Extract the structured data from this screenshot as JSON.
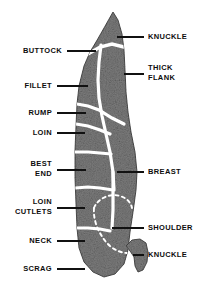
{
  "diagram": {
    "colors": {
      "meat_fill": "#7d7d7d",
      "meat_fill_dark": "#6a6a6a",
      "outline": "#3a3a3a",
      "separator": "#ffffff",
      "label_text": "#0d0d0d",
      "leader_line": "#111111",
      "background": "#ffffff"
    },
    "left_labels": [
      {
        "id": "buttock",
        "lines": [
          "BUTTOCK"
        ],
        "text_x": 62,
        "text_y": 51,
        "leader_x1": 67,
        "leader_x2": 96,
        "leader_y": 51
      },
      {
        "id": "fillet",
        "lines": [
          "FILLET"
        ],
        "text_x": 52,
        "text_y": 86,
        "leader_x1": 57,
        "leader_x2": 88,
        "leader_y": 86
      },
      {
        "id": "rump",
        "lines": [
          "RUMP"
        ],
        "text_x": 52,
        "text_y": 113,
        "leader_x1": 57,
        "leader_x2": 86,
        "leader_y": 113
      },
      {
        "id": "loin",
        "lines": [
          "LOIN"
        ],
        "text_x": 52,
        "text_y": 133,
        "leader_x1": 57,
        "leader_x2": 85,
        "leader_y": 133
      },
      {
        "id": "best-end",
        "lines": [
          "BEST",
          "END"
        ],
        "text_x": 52,
        "text_y": 164,
        "leader_x1": 57,
        "leader_x2": 86,
        "leader_y": 170
      },
      {
        "id": "loin-cutlets",
        "lines": [
          "LOIN",
          "CUTLETS"
        ],
        "text_x": 52,
        "text_y": 202,
        "leader_x1": 57,
        "leader_x2": 85,
        "leader_y": 208
      },
      {
        "id": "neck",
        "lines": [
          "NECK"
        ],
        "text_x": 52,
        "text_y": 241,
        "leader_x1": 57,
        "leader_x2": 85,
        "leader_y": 241
      },
      {
        "id": "scrag",
        "lines": [
          "SCRAG"
        ],
        "text_x": 52,
        "text_y": 269,
        "leader_x1": 57,
        "leader_x2": 85,
        "leader_y": 269
      }
    ],
    "right_labels": [
      {
        "id": "knuckle-top",
        "lines": [
          "KNUCKLE"
        ],
        "text_x": 148,
        "text_y": 37,
        "leader_x1": 117,
        "leader_x2": 144,
        "leader_y": 37
      },
      {
        "id": "thick-flank",
        "lines": [
          "THICK",
          "FLANK"
        ],
        "text_x": 148,
        "text_y": 68,
        "leader_x1": 124,
        "leader_x2": 144,
        "leader_y": 74
      },
      {
        "id": "breast",
        "lines": [
          "BREAST"
        ],
        "text_x": 148,
        "text_y": 172,
        "leader_x1": 117,
        "leader_x2": 144,
        "leader_y": 172
      },
      {
        "id": "shoulder",
        "lines": [
          "SHOULDER"
        ],
        "text_x": 148,
        "text_y": 228,
        "leader_x1": 112,
        "leader_x2": 144,
        "leader_y": 228
      },
      {
        "id": "knuckle-bot",
        "lines": [
          "KNUCKLE"
        ],
        "text_x": 148,
        "text_y": 255,
        "leader_x1": 133,
        "leader_x2": 144,
        "leader_y": 255
      }
    ],
    "regions": [
      {
        "id": "knuckle-top-region",
        "name": "KNUCKLE"
      },
      {
        "id": "buttock-region",
        "name": "BUTTOCK"
      },
      {
        "id": "thick-flank-region",
        "name": "THICK FLANK"
      },
      {
        "id": "fillet-region",
        "name": "FILLET"
      },
      {
        "id": "rump-region",
        "name": "RUMP"
      },
      {
        "id": "loin-region",
        "name": "LOIN"
      },
      {
        "id": "best-end-region",
        "name": "BEST END"
      },
      {
        "id": "loin-cutlets-region",
        "name": "LOIN CUTLETS"
      },
      {
        "id": "neck-region",
        "name": "NECK"
      },
      {
        "id": "scrag-region",
        "name": "SCRAG"
      },
      {
        "id": "breast-region",
        "name": "BREAST"
      },
      {
        "id": "shoulder-region",
        "name": "SHOULDER"
      },
      {
        "id": "knuckle-bot-region",
        "name": "KNUCKLE"
      }
    ]
  }
}
